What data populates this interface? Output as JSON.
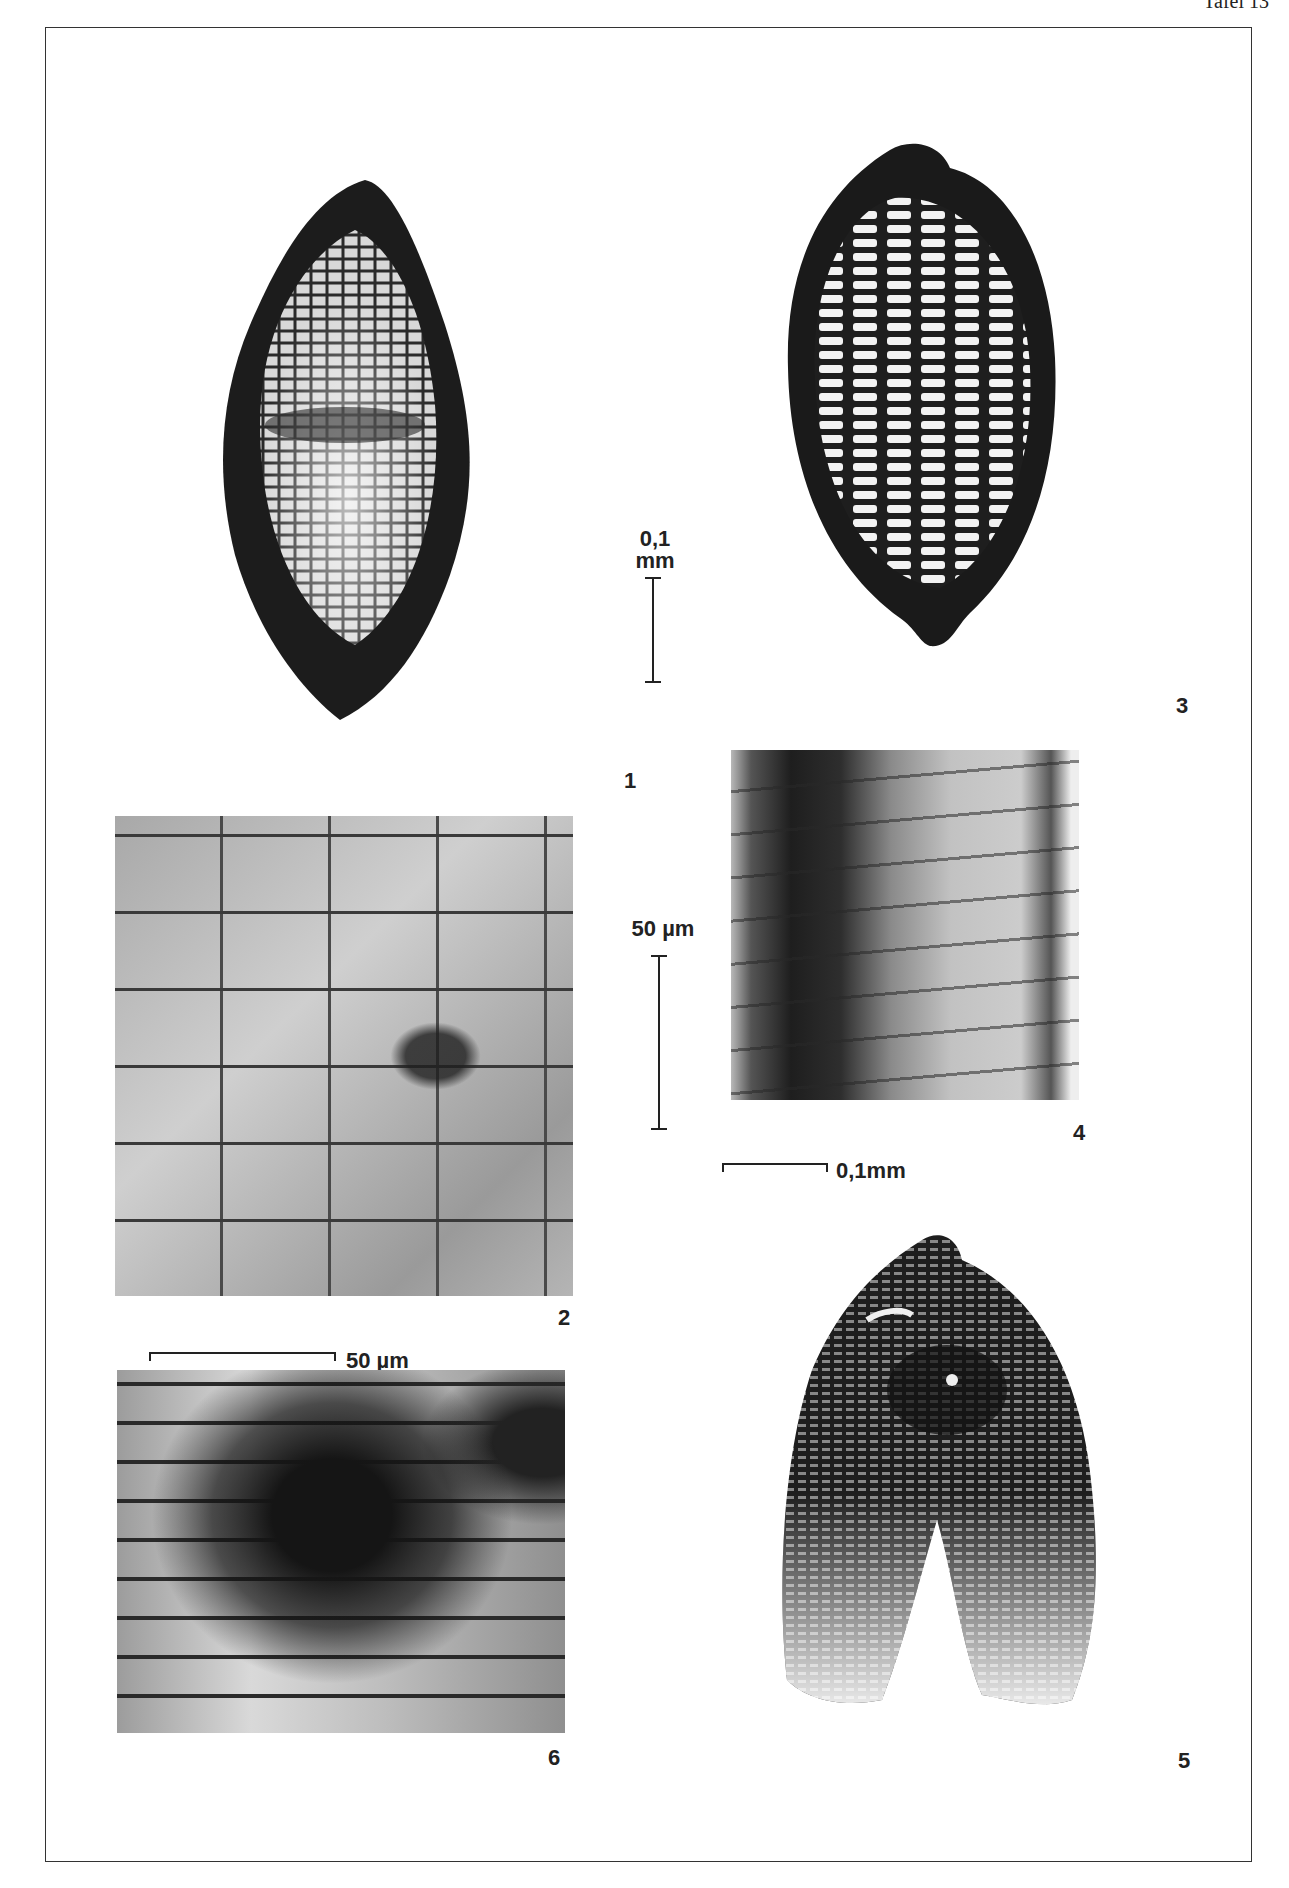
{
  "page": {
    "header": "Tafel 13"
  },
  "figures": [
    {
      "id": "1",
      "label": "1",
      "type": "seed",
      "description": "fusiform seed with reticulate cellular surface"
    },
    {
      "id": "2",
      "label": "2",
      "type": "micrograph",
      "description": "epidermal cell pattern, light micrograph"
    },
    {
      "id": "3",
      "label": "3",
      "type": "seed",
      "description": "ovoid seed with longitudinal rows of transverse cells"
    },
    {
      "id": "4",
      "label": "4",
      "type": "micrograph",
      "description": "cell rows with dark band, light micrograph"
    },
    {
      "id": "5",
      "label": "5",
      "type": "seed",
      "description": "split seed coat with ribbed structure"
    },
    {
      "id": "6",
      "label": "6",
      "type": "micrograph",
      "description": "elongated cells with dark staining, light micrograph"
    }
  ],
  "scale_bars": {
    "fig1_3": {
      "value": "0,1",
      "unit": "mm"
    },
    "fig2": {
      "label": "50 µm"
    },
    "fig4": {
      "label": "0,1mm"
    },
    "fig6": {
      "label": "50 µm"
    }
  }
}
